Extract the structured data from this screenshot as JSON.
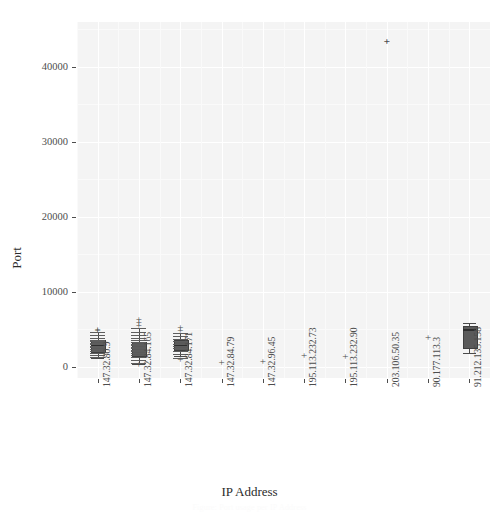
{
  "figure": {
    "title": "",
    "caption": "Figure: Port usage per IP Address"
  },
  "axes": {
    "ylabel": "Port",
    "xlabel": "IP Address"
  },
  "chart_data": {
    "type": "box",
    "title": "",
    "xlabel": "IP Address",
    "ylabel": "Port",
    "ylim": [
      -1500,
      46000
    ],
    "yticks": [
      0,
      10000,
      20000,
      30000,
      40000
    ],
    "ytick_labels": [
      "0",
      "10000",
      "20000",
      "30000",
      "40000"
    ],
    "grid": true,
    "legend": "none",
    "categories": [
      "147.32.80.9",
      "147.32.84.165",
      "147.32.84.171",
      "147.32.84.79",
      "147.32.96.45",
      "195.113.232.73",
      "195.113.232.90",
      "203.106.50.35",
      "90.177.113.3",
      "91.212.135.158"
    ],
    "boxes": [
      {
        "category": "147.32.80.9",
        "min": 1200,
        "q1": 2100,
        "median": 2900,
        "q3": 3600,
        "max": 4600,
        "outliers": [
          4900,
          5100
        ]
      },
      {
        "category": "147.32.84.165",
        "min": 400,
        "q1": 1600,
        "median": 2300,
        "q3": 3300,
        "max": 5200,
        "outliers": [
          5600,
          6000,
          6400,
          400
        ]
      },
      {
        "category": "147.32.84.171",
        "min": 1500,
        "q1": 2400,
        "median": 2900,
        "q3": 3600,
        "max": 4500,
        "outliers": [
          1100,
          4900,
          5300
        ]
      },
      {
        "category": "147.32.84.79",
        "min": 700,
        "q1": 700,
        "median": 700,
        "q3": 700,
        "max": 700,
        "outliers": []
      },
      {
        "category": "147.32.96.45",
        "min": 800,
        "q1": 800,
        "median": 800,
        "q3": 800,
        "max": 800,
        "outliers": []
      },
      {
        "category": "195.113.232.73",
        "min": 1600,
        "q1": 1600,
        "median": 1600,
        "q3": 1600,
        "max": 1600,
        "outliers": []
      },
      {
        "category": "195.113.232.90",
        "min": 1400,
        "q1": 1400,
        "median": 1400,
        "q3": 1400,
        "max": 1400,
        "outliers": []
      },
      {
        "category": "203.106.50.35",
        "min": 43500,
        "q1": 43500,
        "median": 43500,
        "q3": 43500,
        "max": 43500,
        "outliers": [
          43500
        ]
      },
      {
        "category": "90.177.113.3",
        "min": 4000,
        "q1": 4000,
        "median": 4000,
        "q3": 4000,
        "max": 4000,
        "outliers": []
      },
      {
        "category": "91.212.135.158",
        "min": 1900,
        "q1": 2600,
        "median": 5000,
        "q3": 5500,
        "max": 5800,
        "outliers": []
      }
    ]
  }
}
